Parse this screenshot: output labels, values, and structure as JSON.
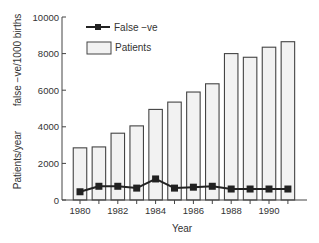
{
  "chart_data": {
    "type": "bar",
    "title": "",
    "xlabel": "Year",
    "ylabel_outer": "Patients/year",
    "ylabel_inner": "false −ve/1000 births",
    "ylim": [
      0,
      10000
    ],
    "yticks": [
      0,
      2000,
      4000,
      6000,
      8000,
      10000
    ],
    "xticks_labeled": [
      "1980",
      "1982",
      "1984",
      "1986",
      "1988",
      "1990"
    ],
    "categories": [
      "1980",
      "1981",
      "1982",
      "1983",
      "1984",
      "1985",
      "1986",
      "1987",
      "1988",
      "1989",
      "1990",
      "1991"
    ],
    "series": [
      {
        "name": "Patients",
        "type": "bar",
        "values": [
          2850,
          2900,
          3650,
          4050,
          4950,
          5350,
          5900,
          6350,
          8000,
          7800,
          8350,
          8650
        ]
      },
      {
        "name": "False −ve",
        "type": "line",
        "marker": "square",
        "values": [
          450,
          750,
          750,
          650,
          1150,
          650,
          700,
          750,
          600,
          600,
          600,
          600
        ]
      }
    ],
    "legend": {
      "position": "upper-left inside",
      "entries": [
        "False −ve",
        "Patients"
      ]
    },
    "grid": false,
    "colors": {
      "bar_fill": "#f2f2f2",
      "bar_stroke": "#444444",
      "line": "#222222",
      "axis": "#444444"
    }
  }
}
